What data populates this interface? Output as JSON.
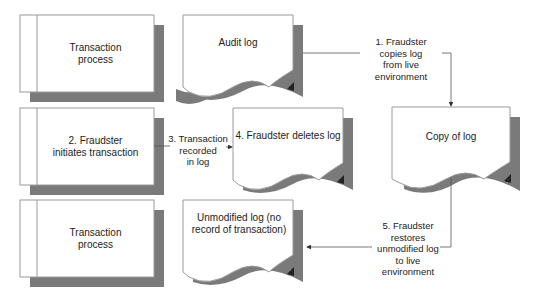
{
  "diagram": {
    "colors": {
      "shadow": "#7a7a7a",
      "border": "#9a9a9a",
      "fill": "#ffffff",
      "line": "#555555",
      "text": "#222222"
    },
    "process_boxes": [
      {
        "id": "p1",
        "label_line1": "Transaction",
        "label_line2": "process"
      },
      {
        "id": "p2",
        "label_line1": "2. Fraudster",
        "label_line2": "initiates transaction"
      },
      {
        "id": "p3",
        "label_line1": "Transaction",
        "label_line2": "process"
      }
    ],
    "documents": [
      {
        "id": "d1",
        "label": "Audit log"
      },
      {
        "id": "d2",
        "label": "4. Fraudster deletes log"
      },
      {
        "id": "d3",
        "label": "Copy of log"
      },
      {
        "id": "d4",
        "label": "Unmodified log (no record of transaction)"
      }
    ],
    "edges": [
      {
        "id": "e1",
        "from": "Audit log",
        "to": "Copy of log",
        "label_lines": [
          "1. Fraudster",
          "copies log",
          "from live environment"
        ]
      },
      {
        "id": "e3",
        "from": "2. Fraudster initiates transaction",
        "to": "4. Fraudster deletes log",
        "label_lines": [
          "3. Transaction",
          "recorded",
          "in log"
        ]
      },
      {
        "id": "e5",
        "from": "Copy of log",
        "to": "Unmodified log (no record of transaction)",
        "label_lines": [
          "5. Fraudster",
          "restores",
          "unmodified log",
          "to live environment"
        ]
      }
    ]
  }
}
